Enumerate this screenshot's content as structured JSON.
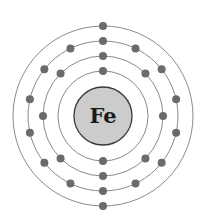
{
  "element": {
    "symbol": "Fe",
    "name": "Iron"
  },
  "shells": [
    {
      "label": "shell-1",
      "electrons": 2
    },
    {
      "label": "shell-2",
      "electrons": 8
    },
    {
      "label": "shell-3",
      "electrons": 14
    },
    {
      "label": "shell-4",
      "electrons": 2
    }
  ],
  "colors": {
    "nucleus_fill": "#cccccc",
    "electron": "#6b6b6b",
    "shell_stroke": "#8a8a8a",
    "symbol": "#1a1a1a"
  }
}
